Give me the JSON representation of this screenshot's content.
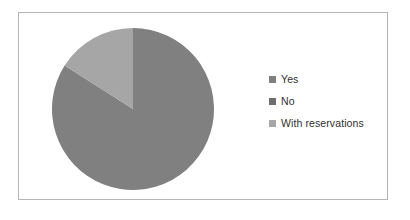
{
  "chart_data": {
    "type": "pie",
    "title": "",
    "subtitle": "",
    "xlabel": "",
    "ylabel": "",
    "grid": false,
    "legend_position": "right",
    "start_angle_deg": 0,
    "direction": "clockwise",
    "categories": [
      "Yes",
      "No",
      "With reservations"
    ],
    "values": [
      84,
      0,
      16
    ],
    "labels_shown": false,
    "slices": [
      {
        "label": "Yes",
        "value": 84,
        "color": "#808080",
        "start_deg": 0,
        "end_deg": 302.4
      },
      {
        "label": "No",
        "value": 0,
        "color": "#6e6e6e",
        "start_deg": 302.4,
        "end_deg": 302.4
      },
      {
        "label": "With reservations",
        "value": 16,
        "color": "#a6a6a6",
        "start_deg": 302.4,
        "end_deg": 360
      }
    ]
  },
  "legend": {
    "items": [
      {
        "label": "Yes",
        "swatch_name": "legend-swatch-yes",
        "color": "#808080"
      },
      {
        "label": "No",
        "swatch_name": "legend-swatch-no",
        "color": "#6e6e6e"
      },
      {
        "label": "With reservations",
        "swatch_name": "legend-swatch-with-reservations",
        "color": "#a6a6a6"
      }
    ]
  },
  "frame": {
    "border_color": "#b6b6b6",
    "background": "#ffffff"
  }
}
